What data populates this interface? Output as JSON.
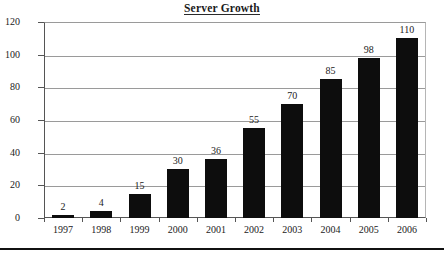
{
  "chart_data": {
    "type": "bar",
    "title": "Server Growth",
    "xlabel": "",
    "ylabel": "",
    "categories": [
      "1997",
      "1998",
      "1999",
      "2000",
      "2001",
      "2002",
      "2003",
      "2004",
      "2005",
      "2006"
    ],
    "values": [
      2,
      4,
      15,
      30,
      36,
      55,
      70,
      85,
      98,
      110
    ],
    "value_labels": [
      "2",
      "4",
      "15",
      "30",
      "36",
      "55",
      "70",
      "85",
      "98",
      "110"
    ],
    "ylim": [
      0,
      120
    ],
    "ytick_labels": [
      "0",
      "20",
      "40",
      "60",
      "80",
      "100",
      "120"
    ],
    "ytick_values": [
      0,
      20,
      40,
      60,
      80,
      100,
      120
    ],
    "grid": true,
    "legend": false,
    "legend_position": "none",
    "series": [
      {
        "name": "Servers",
        "values": [
          2,
          4,
          15,
          30,
          36,
          55,
          70,
          85,
          98,
          110
        ]
      }
    ],
    "colors": {
      "bar": "#0d0d0d",
      "gridline": "#9a9a9a",
      "axis": "#555555",
      "text": "#222222",
      "background": "#ffffff",
      "rule": "#111111"
    }
  }
}
